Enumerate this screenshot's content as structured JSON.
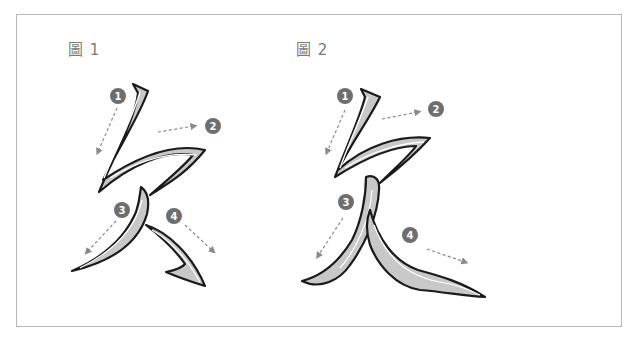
{
  "figures": [
    {
      "label": "圖 1",
      "character": "夂 (variant)",
      "strokes": [
        {
          "order": "1",
          "direction": "down-left"
        },
        {
          "order": "2",
          "direction": "right"
        },
        {
          "order": "3",
          "direction": "down-left"
        },
        {
          "order": "4",
          "direction": "down-right"
        }
      ]
    },
    {
      "label": "圖 2",
      "character": "夊 (variant)",
      "strokes": [
        {
          "order": "1",
          "direction": "down-left"
        },
        {
          "order": "2",
          "direction": "right"
        },
        {
          "order": "3",
          "direction": "down-left"
        },
        {
          "order": "4",
          "direction": "down-right"
        }
      ]
    }
  ],
  "colors": {
    "frame_border": "#b8b8b8",
    "label_text": "#7a7a7a",
    "badge_fill": "#6e6e6e",
    "arrow": "#8a8a8a",
    "stroke_outline": "#1a1a1a",
    "stroke_fill": "#bdbdbd"
  }
}
